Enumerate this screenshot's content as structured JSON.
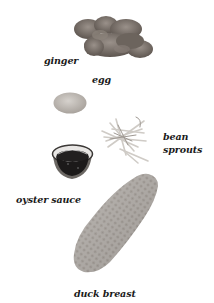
{
  "ingredients": [
    {
      "id": "ginger",
      "label": "ginger"
    },
    {
      "id": "egg",
      "label": "egg"
    },
    {
      "id": "bean-sprouts",
      "label_line1": "bean",
      "label_line2": "sprouts"
    },
    {
      "id": "oyster-sauce",
      "label": "oyster sauce"
    },
    {
      "id": "duck-breast",
      "label": "duck breast"
    }
  ],
  "colors": {
    "background": "#ffffff",
    "text": "#1a1a1a",
    "ginger": "#7a6f66",
    "egg": "#c8c3bd",
    "sprouts": "#d9d6d2",
    "sauce": "#1c1a1a",
    "duck": "#b0aba6"
  }
}
